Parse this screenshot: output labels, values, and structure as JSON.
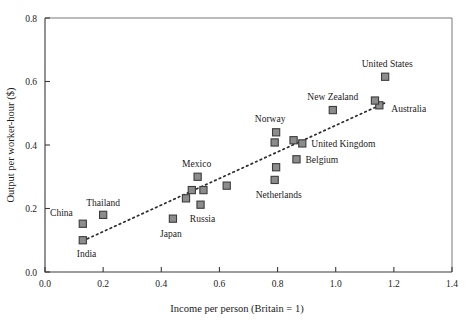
{
  "chart_data": {
    "type": "scatter",
    "title": "",
    "xlabel": "Income per person (Britain = 1)",
    "ylabel": "Output per worker-hour ($)",
    "xlim": [
      0.0,
      1.4
    ],
    "ylim": [
      0.0,
      0.8
    ],
    "xticks": [
      "0.0",
      "0.2",
      "0.4",
      "0.6",
      "0.8",
      "1.0",
      "1.2",
      "1.4"
    ],
    "xtick_values": [
      0.0,
      0.2,
      0.4,
      0.6,
      0.8,
      1.0,
      1.2,
      1.4
    ],
    "yticks": [
      "0.0",
      "0.2",
      "0.4",
      "0.6",
      "0.8"
    ],
    "ytick_values": [
      0.0,
      0.2,
      0.4,
      0.6,
      0.8
    ],
    "grid": false,
    "legend": "none",
    "marker_color": "#8c8c8c",
    "marker_edge_color": "#3c3c3c",
    "trendline": {
      "style": "dotted",
      "color": "#2b2b2b",
      "x_start": 0.13,
      "y_start": 0.098,
      "x_end": 1.175,
      "y_end": 0.535
    },
    "points": [
      {
        "name": "India",
        "x": 0.13,
        "y": 0.1,
        "label_dx": -6,
        "label_dy": 17,
        "label_anchor": "start"
      },
      {
        "name": "China",
        "x": 0.13,
        "y": 0.152,
        "label_dx": -10,
        "label_dy": -8,
        "label_anchor": "end"
      },
      {
        "name": "Thailand",
        "x": 0.2,
        "y": 0.18,
        "label_dx": 0,
        "label_dy": -9,
        "label_anchor": "middle"
      },
      {
        "name": "Japan",
        "x": 0.44,
        "y": 0.168,
        "label_dx": -2,
        "label_dy": 18,
        "label_anchor": "middle"
      },
      {
        "name": "Russia",
        "x": 0.535,
        "y": 0.212,
        "label_dx": 2,
        "label_dy": 17,
        "label_anchor": "middle"
      },
      {
        "name": "Mexico",
        "x": 0.525,
        "y": 0.3,
        "label_dx": -1,
        "label_dy": -10,
        "label_anchor": "middle"
      },
      {
        "name": "",
        "x": 0.485,
        "y": 0.232,
        "label_dx": 0,
        "label_dy": 0,
        "label_anchor": "middle"
      },
      {
        "name": "",
        "x": 0.505,
        "y": 0.258,
        "label_dx": 0,
        "label_dy": 0,
        "label_anchor": "middle"
      },
      {
        "name": "",
        "x": 0.545,
        "y": 0.258,
        "label_dx": 0,
        "label_dy": 0,
        "label_anchor": "middle"
      },
      {
        "name": "",
        "x": 0.625,
        "y": 0.272,
        "label_dx": 0,
        "label_dy": 0,
        "label_anchor": "middle"
      },
      {
        "name": "Norway",
        "x": 0.795,
        "y": 0.44,
        "label_dx": -6,
        "label_dy": -10,
        "label_anchor": "middle"
      },
      {
        "name": "",
        "x": 0.79,
        "y": 0.408,
        "label_dx": 0,
        "label_dy": 0,
        "label_anchor": "middle"
      },
      {
        "name": "Netherlands",
        "x": 0.79,
        "y": 0.29,
        "label_dx": 4,
        "label_dy": 18,
        "label_anchor": "middle"
      },
      {
        "name": "",
        "x": 0.795,
        "y": 0.33,
        "label_dx": 0,
        "label_dy": 0,
        "label_anchor": "middle"
      },
      {
        "name": "United Kingdom",
        "x": 0.885,
        "y": 0.405,
        "label_dx": 9,
        "label_dy": 4,
        "label_anchor": "start"
      },
      {
        "name": "",
        "x": 0.855,
        "y": 0.415,
        "label_dx": 0,
        "label_dy": 0,
        "label_anchor": "middle"
      },
      {
        "name": "Belgium",
        "x": 0.865,
        "y": 0.355,
        "label_dx": 9,
        "label_dy": 4,
        "label_anchor": "start"
      },
      {
        "name": "New Zealand",
        "x": 0.99,
        "y": 0.51,
        "label_dx": 0,
        "label_dy": -10,
        "label_anchor": "middle"
      },
      {
        "name": "Australia",
        "x": 1.15,
        "y": 0.525,
        "label_dx": 12,
        "label_dy": 7,
        "label_anchor": "start"
      },
      {
        "name": "",
        "x": 1.135,
        "y": 0.54,
        "label_dx": 0,
        "label_dy": 0,
        "label_anchor": "middle"
      },
      {
        "name": "United States",
        "x": 1.17,
        "y": 0.615,
        "label_dx": 2,
        "label_dy": -10,
        "label_anchor": "middle"
      }
    ]
  }
}
